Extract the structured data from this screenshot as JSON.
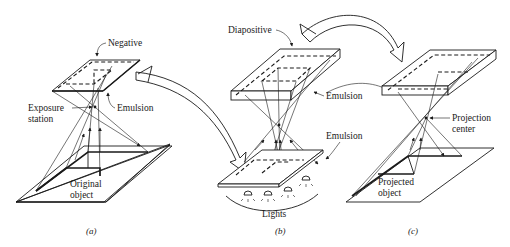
{
  "figure": {
    "panels": [
      {
        "id": "a",
        "caption": "(a)",
        "labels": {
          "negative": "Negative",
          "emulsion": "Emulsion",
          "exposure_line1": "Exposure",
          "exposure_line2": "station",
          "object_line1": "Original",
          "object_line2": "object"
        }
      },
      {
        "id": "b",
        "caption": "(b)",
        "labels": {
          "diapositive": "Diapositive",
          "emulsion_top": "Emulsion",
          "emulsion_bottom": "Emulsion",
          "lights": "Lights"
        }
      },
      {
        "id": "c",
        "caption": "(c)",
        "labels": {
          "projection_line1": "Projection",
          "projection_line2": "center",
          "object_line1": "Projected",
          "object_line2": "object"
        }
      }
    ]
  }
}
